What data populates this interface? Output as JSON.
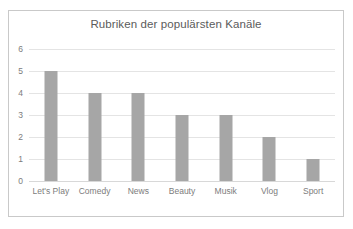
{
  "chart_data": {
    "type": "bar",
    "title": "Rubriken der populärsten Kanäle",
    "xlabel": "",
    "ylabel": "",
    "categories": [
      "Let's Play",
      "Comedy",
      "News",
      "Beauty",
      "Musik",
      "Vlog",
      "Sport"
    ],
    "values": [
      5,
      4,
      4,
      3,
      3,
      2,
      1
    ],
    "ylim": [
      0,
      6
    ],
    "ytick_step": 1,
    "yticks": [
      "0",
      "1",
      "2",
      "3",
      "4",
      "5",
      "6"
    ],
    "grid": true,
    "legend": false,
    "legend_position": "none",
    "series": [
      {
        "name": "Anzahl",
        "values": [
          5,
          4,
          4,
          3,
          3,
          2,
          1
        ]
      }
    ],
    "colors": {
      "bar": "#a6a6a6",
      "gridline": "#e4e4e4",
      "baseline": "#d8d8d8",
      "title_text": "#5b5b5b",
      "tick_text": "#7c7c7c",
      "frame_border": "#c9c9c9",
      "plot_background": "#ffffff"
    }
  }
}
